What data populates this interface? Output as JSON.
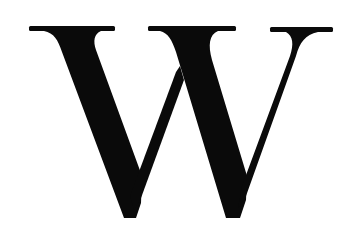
{
  "image": {
    "background_color": "#ffffff",
    "glyph": {
      "character": "W",
      "style": "serif",
      "color": "#0a0a0a"
    }
  }
}
